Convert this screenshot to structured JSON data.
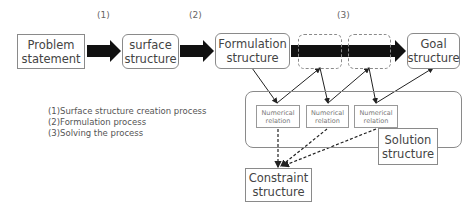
{
  "diagram": {
    "step_labels": [
      "(1)",
      "(2)",
      "(3)"
    ],
    "nodes": {
      "problem_statement": "Problem\nstatement",
      "surface_structure": "surface\nstructure",
      "formulation_structure": "Formulation\nstructure",
      "goal_structure": "Goal\nstructure",
      "numerical_relations": [
        "Numerical\nrelation",
        "Numerical\nrelation",
        "Numerical\nrelation"
      ],
      "solution_structure": "Solution\nstructure",
      "constraint_structure": "Constraint\nstructure"
    },
    "legend": [
      "(1)Surface structure creation process",
      "(2)Formulation process",
      "(3)Solving the process"
    ],
    "colors": {
      "arrow_fill": "#111111",
      "border": "#8a8a8a",
      "text": "#444444"
    }
  }
}
